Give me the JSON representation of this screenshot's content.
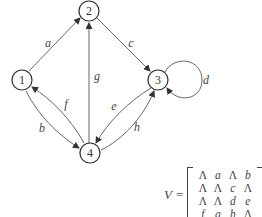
{
  "graph": {
    "nodes": [
      {
        "id": "1",
        "label": "1"
      },
      {
        "id": "2",
        "label": "2"
      },
      {
        "id": "3",
        "label": "3"
      },
      {
        "id": "4",
        "label": "4"
      }
    ],
    "edges": [
      {
        "from": "1",
        "to": "2",
        "label": "a"
      },
      {
        "from": "1",
        "to": "4",
        "label": "b"
      },
      {
        "from": "2",
        "to": "3",
        "label": "c"
      },
      {
        "from": "3",
        "to": "3",
        "label": "d"
      },
      {
        "from": "4",
        "to": "3",
        "label": "e"
      },
      {
        "from": "4",
        "to": "1",
        "label": "f"
      },
      {
        "from": "4",
        "to": "2",
        "label": "g"
      },
      {
        "from": "4",
        "to": "3",
        "label": "h"
      }
    ]
  },
  "matrix": {
    "name": "V",
    "equals": "=",
    "rows": [
      [
        "Λ",
        "a",
        "Λ",
        "b"
      ],
      [
        "Λ",
        "Λ",
        "c",
        "Λ"
      ],
      [
        "Λ",
        "Λ",
        "d",
        "e"
      ],
      [
        "f",
        "g",
        "h",
        "Λ"
      ]
    ]
  }
}
